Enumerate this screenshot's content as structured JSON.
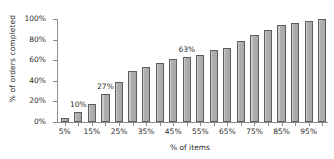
{
  "chart_data": {
    "type": "bar",
    "title": "",
    "xlabel": "% of items",
    "ylabel": "% of orders completed",
    "ylim": [
      0,
      100
    ],
    "grid": false,
    "legend": "none",
    "ytick_labels": [
      "0%",
      "20%",
      "40%",
      "60%",
      "80%",
      "100%"
    ],
    "ytick_values": [
      0,
      20,
      40,
      60,
      80,
      100
    ],
    "categories": [
      "5%",
      "10%",
      "15%",
      "20%",
      "25%",
      "30%",
      "35%",
      "40%",
      "45%",
      "50%",
      "55%",
      "60%",
      "65%",
      "70%",
      "75%",
      "80%",
      "85%",
      "90%",
      "95%",
      "100%"
    ],
    "xtick_labels_shown": [
      "5%",
      "15%",
      "25%",
      "35%",
      "45%",
      "55%",
      "65%",
      "75%",
      "85%",
      "95%"
    ],
    "values": [
      4,
      10,
      17,
      27,
      39,
      50,
      53,
      57,
      61,
      63,
      65,
      70,
      72,
      79,
      84,
      89,
      94,
      96,
      98,
      100
    ],
    "annotations": [
      {
        "label": "10%",
        "category": "10%",
        "value": 10
      },
      {
        "label": "27%",
        "category": "20%",
        "value": 27
      },
      {
        "label": "63%",
        "category": "50%",
        "value": 63
      }
    ],
    "colors": {
      "bar_fill": "#b3b3b3",
      "bar_edge": "#5e5e5e",
      "axis": "#8c8c8c",
      "text": "#2b2b2b",
      "background": "#ffffff"
    }
  }
}
